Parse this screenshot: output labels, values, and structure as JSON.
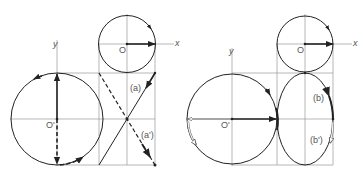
{
  "left_panel": {
    "labels": {
      "x_axis": "x",
      "y_axis": "y",
      "origin": "O",
      "origin_prime": "O'",
      "curve_a": "(a)",
      "curve_a_prime": "(a')"
    }
  },
  "right_panel": {
    "labels": {
      "x_axis": "x",
      "y_axis": "y",
      "origin": "O",
      "origin_prime": "O'",
      "curve_b": "(b)",
      "curve_b_prime": "(b')"
    }
  },
  "colors": {
    "line": "#222222",
    "grid": "#999999",
    "label": "#555555"
  }
}
